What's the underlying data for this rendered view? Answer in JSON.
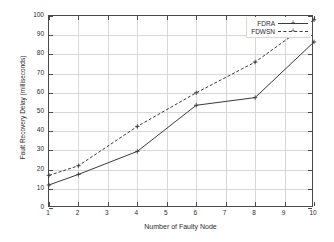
{
  "chart_data": {
    "type": "line",
    "title": "",
    "xlabel": "Number of Faulty Node",
    "ylabel": "Fault Recovery Delay (milliseconds)",
    "xlim": [
      1,
      10
    ],
    "ylim": [
      0,
      100
    ],
    "grid": true,
    "legend_position": "top-right",
    "x": [
      1,
      2,
      4,
      6,
      8,
      10
    ],
    "xticks": [
      "1",
      "2",
      "3",
      "4",
      "5",
      "6",
      "7",
      "8",
      "9",
      "10"
    ],
    "xtick_values": [
      1,
      2,
      3,
      4,
      5,
      6,
      7,
      8,
      9,
      10
    ],
    "yticks": [
      "0",
      "10",
      "20",
      "30",
      "40",
      "50",
      "60",
      "70",
      "80",
      "90",
      "100"
    ],
    "ytick_values": [
      0,
      10,
      20,
      30,
      40,
      50,
      60,
      70,
      80,
      90,
      100
    ],
    "series": [
      {
        "name": "FDRA",
        "style": "solid",
        "marker": "plus",
        "color": "#3a3a3a",
        "x": [
          1,
          2,
          4,
          6,
          8,
          10
        ],
        "values": [
          12,
          17.5,
          29.5,
          53.5,
          57.5,
          86.5
        ]
      },
      {
        "name": "FDWSN",
        "style": "dashed",
        "marker": "plus",
        "color": "#3a3a3a",
        "x": [
          1,
          2,
          4,
          6,
          8,
          10
        ],
        "values": [
          17,
          22,
          42.5,
          60,
          76,
          98
        ]
      }
    ]
  },
  "legend": {
    "entries": [
      {
        "label": "FDRA"
      },
      {
        "label": "FDWSN"
      }
    ]
  },
  "axes": {
    "x_title": "Number of Faulty Node",
    "y_title": "Fault Recovery Delay (milliseconds)"
  }
}
